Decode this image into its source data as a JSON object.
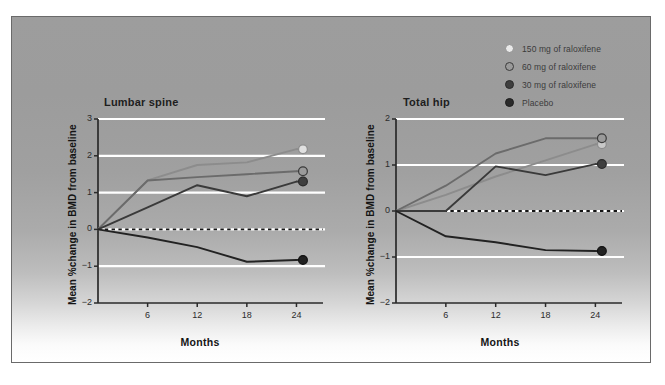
{
  "figure": {
    "background_color": "#ffffff",
    "panel_color_top": "#9d9d9d",
    "panel_color_bottom": "#ffffff",
    "panel_border_color": "#6a6a6a",
    "gridline_color": "#ffffff"
  },
  "legend": {
    "position": "top-right",
    "items": [
      {
        "label": "150 mg of raloxifene",
        "marker": "open-circle",
        "color": "#e9e9e9",
        "edge": "#8e8e8e"
      },
      {
        "label": "60 mg of raloxifene",
        "marker": "gray-circle",
        "color": "#9a9a9a",
        "edge": "#3a3a3a"
      },
      {
        "label": "30 mg of raloxifene",
        "marker": "dark-circle",
        "color": "#3f3f3f",
        "edge": "#2a2a2a"
      },
      {
        "label": "Placebo",
        "marker": "black-circle",
        "color": "#2b2b2b",
        "edge": "#1d1d1d"
      }
    ]
  },
  "chart_data": [
    {
      "type": "line",
      "title": "Lumbar spine",
      "xlabel": "Months",
      "ylabel": "Mean %change in BMD from baseline",
      "x": [
        0,
        6,
        12,
        18,
        24
      ],
      "xticks": [
        6,
        12,
        18,
        24
      ],
      "xlim": [
        0,
        26
      ],
      "ylim": [
        -2,
        3
      ],
      "yticks": [
        3,
        2,
        1,
        0,
        -1,
        -2
      ],
      "ytick_labels": [
        "3",
        "2",
        "1",
        "0",
        "−1",
        "−2"
      ],
      "grid": "horizontal-white",
      "zero_reference_line": true,
      "series": [
        {
          "name": "150 mg of raloxifene",
          "values": [
            0,
            1.33,
            1.75,
            1.82,
            2.18
          ],
          "color": "#8c8c8c",
          "marker_fill": "#e0e0e0",
          "marker_edge": "#8c8c8c",
          "endpoint_marker": true
        },
        {
          "name": "60 mg of raloxifene",
          "values": [
            0,
            1.33,
            1.42,
            1.5,
            1.58
          ],
          "color": "#6b6b6b",
          "marker_fill": "#9a9a9a",
          "marker_edge": "#3a3a3a",
          "endpoint_marker": true
        },
        {
          "name": "30 mg of raloxifene",
          "values": [
            0,
            0.6,
            1.2,
            0.9,
            1.3
          ],
          "color": "#3a3a3a",
          "marker_fill": "#3f3f3f",
          "marker_edge": "#2a2a2a",
          "endpoint_marker": true
        },
        {
          "name": "Placebo",
          "values": [
            0,
            -0.22,
            -0.48,
            -0.88,
            -0.83
          ],
          "color": "#222222",
          "marker_fill": "#222222",
          "marker_edge": "#111111",
          "endpoint_marker": true
        }
      ]
    },
    {
      "type": "line",
      "title": "Total hip",
      "xlabel": "Months",
      "ylabel": "Mean %change in BMD from baseline",
      "x": [
        0,
        6,
        12,
        18,
        24
      ],
      "xticks": [
        6,
        12,
        18,
        24
      ],
      "xlim": [
        0,
        26
      ],
      "ylim": [
        -2,
        2
      ],
      "yticks": [
        2,
        1,
        0,
        -1,
        -2
      ],
      "ytick_labels": [
        "2",
        "1",
        "0",
        "−1",
        "−2"
      ],
      "grid": "horizontal-white",
      "zero_reference_line": true,
      "series": [
        {
          "name": "150 mg of raloxifene",
          "values": [
            0,
            0.35,
            0.75,
            1.1,
            1.45
          ],
          "color": "#8c8c8c",
          "marker_fill": "#c8c8c8",
          "marker_edge": "#8c8c8c",
          "endpoint_marker": true
        },
        {
          "name": "60 mg of raloxifene",
          "values": [
            0,
            0.55,
            1.25,
            1.58,
            1.58
          ],
          "color": "#6b6b6b",
          "marker_fill": "#9a9a9a",
          "marker_edge": "#3a3a3a",
          "endpoint_marker": true
        },
        {
          "name": "30 mg of raloxifene",
          "values": [
            0,
            0.0,
            0.97,
            0.78,
            1.02
          ],
          "color": "#3a3a3a",
          "marker_fill": "#3f3f3f",
          "marker_edge": "#2a2a2a",
          "endpoint_marker": true
        },
        {
          "name": "Placebo",
          "values": [
            0,
            -0.55,
            -0.68,
            -0.85,
            -0.87
          ],
          "color": "#222222",
          "marker_fill": "#222222",
          "marker_edge": "#111111",
          "endpoint_marker": true
        }
      ]
    }
  ]
}
